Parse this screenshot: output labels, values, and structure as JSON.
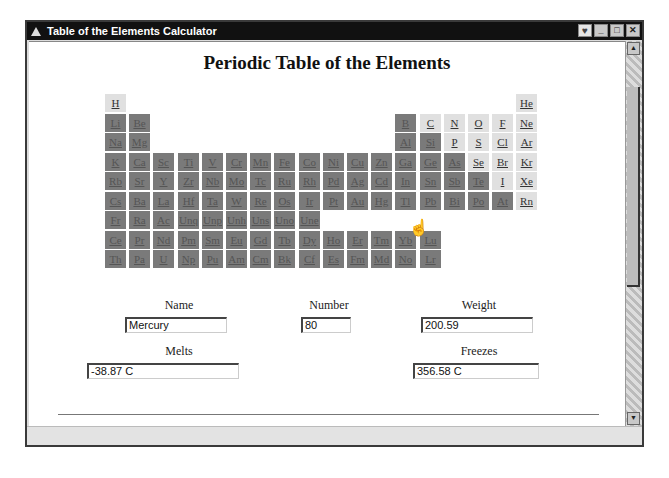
{
  "window": {
    "title": "Table of the Elements Calculator",
    "buttons": {
      "extra": "♥",
      "minimize": "_",
      "maximize": "□",
      "close": "✕"
    }
  },
  "page": {
    "heading": "Periodic Table of the Elements"
  },
  "colors": {
    "dark_cell": "#7a7a7a",
    "light_cell": "#e0e0e0",
    "titlebar": "#111111"
  },
  "elements": [
    {
      "s": "H",
      "c": 0,
      "r": 0,
      "t": "light"
    },
    {
      "s": "He",
      "c": 17,
      "r": 0,
      "t": "light"
    },
    {
      "s": "Li",
      "c": 0,
      "r": 1,
      "t": "dark"
    },
    {
      "s": "Be",
      "c": 1,
      "r": 1,
      "t": "dark"
    },
    {
      "s": "B",
      "c": 12,
      "r": 1,
      "t": "dark"
    },
    {
      "s": "C",
      "c": 13,
      "r": 1,
      "t": "light"
    },
    {
      "s": "N",
      "c": 14,
      "r": 1,
      "t": "light"
    },
    {
      "s": "O",
      "c": 15,
      "r": 1,
      "t": "light"
    },
    {
      "s": "F",
      "c": 16,
      "r": 1,
      "t": "light"
    },
    {
      "s": "Ne",
      "c": 17,
      "r": 1,
      "t": "light"
    },
    {
      "s": "Na",
      "c": 0,
      "r": 2,
      "t": "dark"
    },
    {
      "s": "Mg",
      "c": 1,
      "r": 2,
      "t": "dark"
    },
    {
      "s": "Al",
      "c": 12,
      "r": 2,
      "t": "dark"
    },
    {
      "s": "Si",
      "c": 13,
      "r": 2,
      "t": "dark"
    },
    {
      "s": "P",
      "c": 14,
      "r": 2,
      "t": "light"
    },
    {
      "s": "S",
      "c": 15,
      "r": 2,
      "t": "light"
    },
    {
      "s": "Cl",
      "c": 16,
      "r": 2,
      "t": "light"
    },
    {
      "s": "Ar",
      "c": 17,
      "r": 2,
      "t": "light"
    },
    {
      "s": "K",
      "c": 0,
      "r": 3,
      "t": "dark"
    },
    {
      "s": "Ca",
      "c": 1,
      "r": 3,
      "t": "dark"
    },
    {
      "s": "Sc",
      "c": 2,
      "r": 3,
      "t": "dark"
    },
    {
      "s": "Ti",
      "c": 3,
      "r": 3,
      "t": "dark"
    },
    {
      "s": "V",
      "c": 4,
      "r": 3,
      "t": "dark"
    },
    {
      "s": "Cr",
      "c": 5,
      "r": 3,
      "t": "dark"
    },
    {
      "s": "Mn",
      "c": 6,
      "r": 3,
      "t": "dark"
    },
    {
      "s": "Fe",
      "c": 7,
      "r": 3,
      "t": "dark"
    },
    {
      "s": "Co",
      "c": 8,
      "r": 3,
      "t": "dark"
    },
    {
      "s": "Ni",
      "c": 9,
      "r": 3,
      "t": "dark"
    },
    {
      "s": "Cu",
      "c": 10,
      "r": 3,
      "t": "dark"
    },
    {
      "s": "Zn",
      "c": 11,
      "r": 3,
      "t": "dark"
    },
    {
      "s": "Ga",
      "c": 12,
      "r": 3,
      "t": "dark"
    },
    {
      "s": "Ge",
      "c": 13,
      "r": 3,
      "t": "dark"
    },
    {
      "s": "As",
      "c": 14,
      "r": 3,
      "t": "dark"
    },
    {
      "s": "Se",
      "c": 15,
      "r": 3,
      "t": "light"
    },
    {
      "s": "Br",
      "c": 16,
      "r": 3,
      "t": "light"
    },
    {
      "s": "Kr",
      "c": 17,
      "r": 3,
      "t": "light"
    },
    {
      "s": "Rb",
      "c": 0,
      "r": 4,
      "t": "dark"
    },
    {
      "s": "Sr",
      "c": 1,
      "r": 4,
      "t": "dark"
    },
    {
      "s": "Y",
      "c": 2,
      "r": 4,
      "t": "dark"
    },
    {
      "s": "Zr",
      "c": 3,
      "r": 4,
      "t": "dark"
    },
    {
      "s": "Nb",
      "c": 4,
      "r": 4,
      "t": "dark"
    },
    {
      "s": "Mo",
      "c": 5,
      "r": 4,
      "t": "dark"
    },
    {
      "s": "Tc",
      "c": 6,
      "r": 4,
      "t": "dark"
    },
    {
      "s": "Ru",
      "c": 7,
      "r": 4,
      "t": "dark"
    },
    {
      "s": "Rh",
      "c": 8,
      "r": 4,
      "t": "dark"
    },
    {
      "s": "Pd",
      "c": 9,
      "r": 4,
      "t": "dark"
    },
    {
      "s": "Ag",
      "c": 10,
      "r": 4,
      "t": "dark"
    },
    {
      "s": "Cd",
      "c": 11,
      "r": 4,
      "t": "dark"
    },
    {
      "s": "In",
      "c": 12,
      "r": 4,
      "t": "dark"
    },
    {
      "s": "Sn",
      "c": 13,
      "r": 4,
      "t": "dark"
    },
    {
      "s": "Sb",
      "c": 14,
      "r": 4,
      "t": "dark"
    },
    {
      "s": "Te",
      "c": 15,
      "r": 4,
      "t": "dark"
    },
    {
      "s": "I",
      "c": 16,
      "r": 4,
      "t": "light"
    },
    {
      "s": "Xe",
      "c": 17,
      "r": 4,
      "t": "light"
    },
    {
      "s": "Cs",
      "c": 0,
      "r": 5,
      "t": "dark"
    },
    {
      "s": "Ba",
      "c": 1,
      "r": 5,
      "t": "dark"
    },
    {
      "s": "La",
      "c": 2,
      "r": 5,
      "t": "dark"
    },
    {
      "s": "Hf",
      "c": 3,
      "r": 5,
      "t": "dark"
    },
    {
      "s": "Ta",
      "c": 4,
      "r": 5,
      "t": "dark"
    },
    {
      "s": "W",
      "c": 5,
      "r": 5,
      "t": "dark"
    },
    {
      "s": "Re",
      "c": 6,
      "r": 5,
      "t": "dark"
    },
    {
      "s": "Os",
      "c": 7,
      "r": 5,
      "t": "dark"
    },
    {
      "s": "Ir",
      "c": 8,
      "r": 5,
      "t": "dark"
    },
    {
      "s": "Pt",
      "c": 9,
      "r": 5,
      "t": "dark"
    },
    {
      "s": "Au",
      "c": 10,
      "r": 5,
      "t": "dark"
    },
    {
      "s": "Hg",
      "c": 11,
      "r": 5,
      "t": "dark"
    },
    {
      "s": "Tl",
      "c": 12,
      "r": 5,
      "t": "dark"
    },
    {
      "s": "Pb",
      "c": 13,
      "r": 5,
      "t": "dark"
    },
    {
      "s": "Bi",
      "c": 14,
      "r": 5,
      "t": "dark"
    },
    {
      "s": "Po",
      "c": 15,
      "r": 5,
      "t": "dark"
    },
    {
      "s": "At",
      "c": 16,
      "r": 5,
      "t": "dark"
    },
    {
      "s": "Rn",
      "c": 17,
      "r": 5,
      "t": "light"
    },
    {
      "s": "Fr",
      "c": 0,
      "r": 6,
      "t": "dark"
    },
    {
      "s": "Ra",
      "c": 1,
      "r": 6,
      "t": "dark"
    },
    {
      "s": "Ac",
      "c": 2,
      "r": 6,
      "t": "dark"
    },
    {
      "s": "Unq",
      "c": 3,
      "r": 6,
      "t": "dark"
    },
    {
      "s": "Unp",
      "c": 4,
      "r": 6,
      "t": "dark"
    },
    {
      "s": "Unh",
      "c": 5,
      "r": 6,
      "t": "dark"
    },
    {
      "s": "Uns",
      "c": 6,
      "r": 6,
      "t": "dark"
    },
    {
      "s": "Uno",
      "c": 7,
      "r": 6,
      "t": "dark"
    },
    {
      "s": "Une",
      "c": 8,
      "r": 6,
      "t": "dark"
    },
    {
      "s": "Ce",
      "c": 0,
      "r": 7,
      "t": "dark"
    },
    {
      "s": "Pr",
      "c": 1,
      "r": 7,
      "t": "dark"
    },
    {
      "s": "Nd",
      "c": 2,
      "r": 7,
      "t": "dark"
    },
    {
      "s": "Pm",
      "c": 3,
      "r": 7,
      "t": "dark"
    },
    {
      "s": "Sm",
      "c": 4,
      "r": 7,
      "t": "dark"
    },
    {
      "s": "Eu",
      "c": 5,
      "r": 7,
      "t": "dark"
    },
    {
      "s": "Gd",
      "c": 6,
      "r": 7,
      "t": "dark"
    },
    {
      "s": "Tb",
      "c": 7,
      "r": 7,
      "t": "dark"
    },
    {
      "s": "Dy",
      "c": 8,
      "r": 7,
      "t": "dark"
    },
    {
      "s": "Ho",
      "c": 9,
      "r": 7,
      "t": "dark"
    },
    {
      "s": "Er",
      "c": 10,
      "r": 7,
      "t": "dark"
    },
    {
      "s": "Tm",
      "c": 11,
      "r": 7,
      "t": "dark"
    },
    {
      "s": "Yb",
      "c": 12,
      "r": 7,
      "t": "dark"
    },
    {
      "s": "Lu",
      "c": 13,
      "r": 7,
      "t": "dark"
    },
    {
      "s": "Th",
      "c": 0,
      "r": 8,
      "t": "dark"
    },
    {
      "s": "Pa",
      "c": 1,
      "r": 8,
      "t": "dark"
    },
    {
      "s": "U",
      "c": 2,
      "r": 8,
      "t": "dark"
    },
    {
      "s": "Np",
      "c": 3,
      "r": 8,
      "t": "dark"
    },
    {
      "s": "Pu",
      "c": 4,
      "r": 8,
      "t": "dark"
    },
    {
      "s": "Am",
      "c": 5,
      "r": 8,
      "t": "dark"
    },
    {
      "s": "Cm",
      "c": 6,
      "r": 8,
      "t": "dark"
    },
    {
      "s": "Bk",
      "c": 7,
      "r": 8,
      "t": "dark"
    },
    {
      "s": "Cf",
      "c": 8,
      "r": 8,
      "t": "dark"
    },
    {
      "s": "Es",
      "c": 9,
      "r": 8,
      "t": "dark"
    },
    {
      "s": "Fm",
      "c": 10,
      "r": 8,
      "t": "dark"
    },
    {
      "s": "Md",
      "c": 11,
      "r": 8,
      "t": "dark"
    },
    {
      "s": "No",
      "c": 12,
      "r": 8,
      "t": "dark"
    },
    {
      "s": "Lr",
      "c": 13,
      "r": 8,
      "t": "dark"
    }
  ],
  "form": {
    "name_label": "Name",
    "name_value": "Mercury",
    "number_label": "Number",
    "number_value": "80",
    "weight_label": "Weight",
    "weight_value": "200.59",
    "melts_label": "Melts",
    "melts_value": "-38.87 C",
    "freezes_label": "Freezes",
    "freezes_value": "356.58 C"
  },
  "scrollbar": {
    "up": "▲",
    "down": "▼"
  },
  "cursor": {
    "icon": "☝",
    "over": "Hg"
  }
}
